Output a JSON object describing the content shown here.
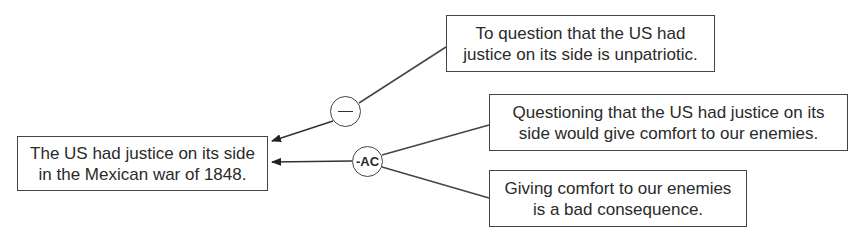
{
  "diagram": {
    "type": "argument-map",
    "conclusion": {
      "lines": [
        "The US had justice on its side",
        "in the Mexican war of 1848."
      ]
    },
    "premises": [
      {
        "id": "p1",
        "lines": [
          "To question that the US had",
          "justice on its side is unpatriotic."
        ]
      },
      {
        "id": "p2",
        "lines": [
          "Questioning that the US had justice on its",
          "side would give comfort to our enemies."
        ]
      },
      {
        "id": "p3",
        "lines": [
          "Giving comfort to our enemies",
          "is a bad consequence."
        ]
      }
    ],
    "connectors": [
      {
        "id": "c1",
        "label": "—",
        "kind": "minus",
        "from": [
          "p1"
        ],
        "to": "conclusion"
      },
      {
        "id": "c2",
        "label": "-AC",
        "kind": "argument-from-consequences",
        "from": [
          "p2",
          "p3"
        ],
        "to": "conclusion"
      }
    ],
    "colors": {
      "stroke": "#444444",
      "text": "#2a2a2a",
      "background": "#ffffff"
    }
  }
}
